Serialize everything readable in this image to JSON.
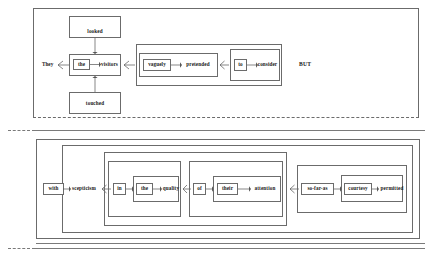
{
  "figure": {
    "title_text": "",
    "panels": [
      {
        "id": "panel-upper",
        "clause_marker": "BUT",
        "nodes": {
          "subject": "They",
          "determiner": "the",
          "object": "visitors",
          "verb_alt_top": "looked",
          "verb_alt_bottom": "touched",
          "adverb": "vaguely",
          "main_verb": "pretended",
          "infinitive_marker": "to",
          "infinitive_verb": "consider"
        },
        "sentence": "They the visitors looked touched vaguely pretended to consider BUT"
      },
      {
        "id": "panel-lower",
        "nodes": {
          "preposition_outer": "with",
          "head_noun": "scepticism",
          "preposition_in": "in",
          "determiner_the": "the",
          "noun_quality": "quality",
          "preposition_of": "of",
          "possessive_their": "their",
          "noun_attention": "attention",
          "conjunction": "so-far-as",
          "noun_courtesy": "courtesy",
          "verb_permitted": "permitted"
        },
        "sentence": "with scepticism in the quality of their attention so-far-as courtesy permitted"
      }
    ],
    "colors": {
      "box_stroke": "#6b6b6b",
      "connector_stroke": "#555555",
      "text": "#1a1a1a",
      "background": "#ffffff"
    }
  }
}
